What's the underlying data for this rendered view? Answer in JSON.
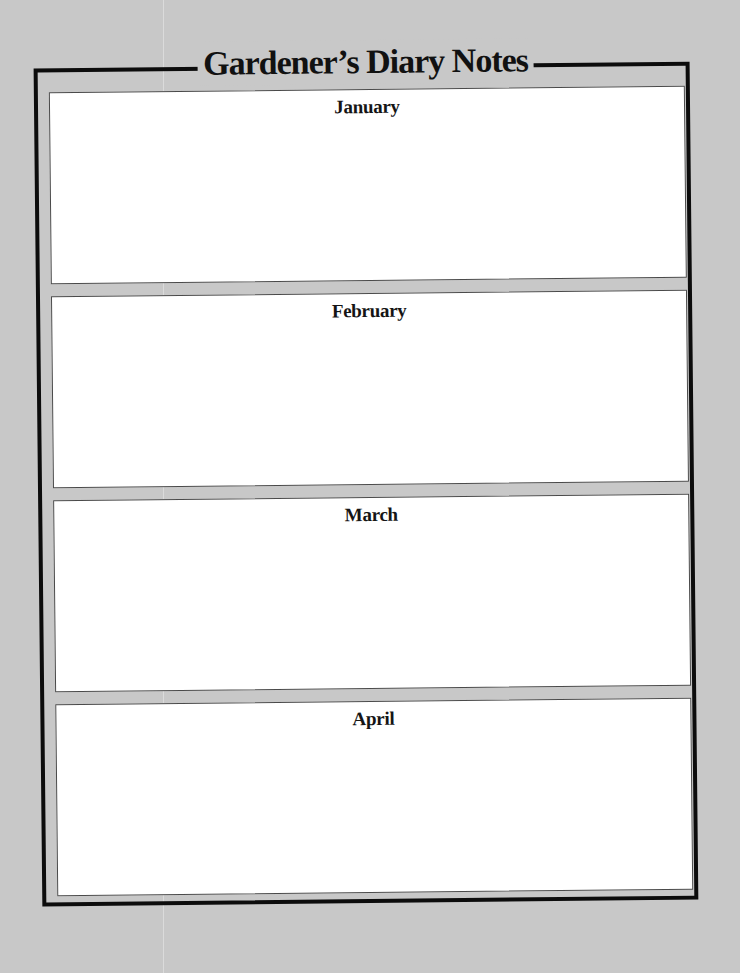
{
  "page": {
    "title": "Gardener’s Diary Notes",
    "background_color": "#c8c8c8",
    "frame_color": "#0c0c0c"
  },
  "months": [
    {
      "label": "January",
      "notes": ""
    },
    {
      "label": "February",
      "notes": ""
    },
    {
      "label": "March",
      "notes": ""
    },
    {
      "label": "April",
      "notes": ""
    }
  ]
}
